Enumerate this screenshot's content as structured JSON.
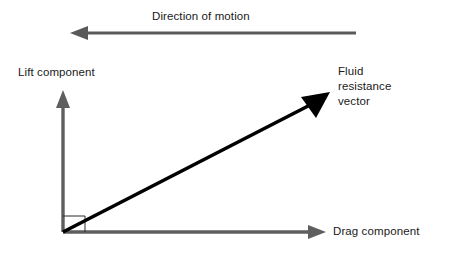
{
  "diagram": {
    "background_color": "#ffffff",
    "labels": {
      "direction_of_motion": "Direction of motion",
      "lift_component": "Lift component",
      "fluid_resistance_vector_line1": "Fluid",
      "fluid_resistance_vector_line2": "resistance",
      "fluid_resistance_vector_line3": "vector",
      "drag_component": "Drag component"
    },
    "colors": {
      "axis_gray": "#5e5e5e",
      "motion_arrow_gray": "#5a5a5a",
      "vector_black": "#000000",
      "text": "#1a1a1a",
      "background": "#ffffff"
    },
    "geometry": {
      "origin_x": 63,
      "origin_y": 232,
      "lift_axis_tip_y": 90,
      "drag_axis_tip_x": 326,
      "resistance_vector_tip_x": 330,
      "resistance_vector_tip_y": 92,
      "motion_arrow_y": 33,
      "motion_arrow_left_tip_x": 70,
      "motion_arrow_right_end_x": 356,
      "right_angle_marker_x2": 85,
      "right_angle_marker_y1": 216
    }
  }
}
